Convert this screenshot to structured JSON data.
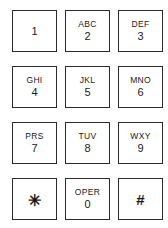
{
  "keypad": {
    "title": "Telephone Keypad",
    "rows": [
      [
        {
          "letters": "",
          "digit": "1",
          "name": "key-1",
          "type": "digit"
        },
        {
          "letters": "ABC",
          "digit": "2",
          "name": "key-2",
          "type": "digit"
        },
        {
          "letters": "DEF",
          "digit": "3",
          "name": "key-3",
          "type": "digit"
        }
      ],
      [
        {
          "letters": "GHI",
          "digit": "4",
          "name": "key-4",
          "type": "digit"
        },
        {
          "letters": "JKL",
          "digit": "5",
          "name": "key-5",
          "type": "digit"
        },
        {
          "letters": "MNO",
          "digit": "6",
          "name": "key-6",
          "type": "digit"
        }
      ],
      [
        {
          "letters": "PRS",
          "digit": "7",
          "name": "key-7",
          "type": "digit"
        },
        {
          "letters": "TUV",
          "digit": "8",
          "name": "key-8",
          "type": "digit"
        },
        {
          "letters": "WXY",
          "digit": "9",
          "name": "key-9",
          "type": "digit"
        }
      ],
      [
        {
          "letters": "",
          "digit": "✳",
          "name": "key-star",
          "type": "star"
        },
        {
          "letters": "OPER",
          "digit": "0",
          "name": "key-0",
          "type": "digit"
        },
        {
          "letters": "",
          "digit": "#",
          "name": "key-hash",
          "type": "symbol"
        }
      ]
    ]
  },
  "colors": {
    "background": "#ffffff",
    "key_border": "#2b2b2b",
    "key_face": "#ffffff",
    "text": "#1a1a1a"
  }
}
